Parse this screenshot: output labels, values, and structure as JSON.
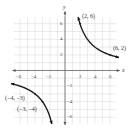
{
  "chart_data": {
    "type": "line",
    "title": "",
    "xlabel": "x",
    "ylabel": "y",
    "xlim": [
      -6,
      6
    ],
    "ylim": [
      -6,
      6
    ],
    "grid": true,
    "x_ticks": [
      -6,
      -4,
      -2,
      2,
      4,
      6
    ],
    "y_ticks": [
      -6,
      -4,
      -2,
      2,
      4,
      6
    ],
    "x_tick_labels": [
      "-6",
      "-4",
      "-2",
      "2",
      "4",
      "6"
    ],
    "y_tick_labels": [
      "-6",
      "-4",
      "-2",
      "2",
      "4",
      "6"
    ],
    "function": "y = 12/x",
    "series": [
      {
        "name": "branch-quadrant-I",
        "x": [
          1.8,
          2,
          3,
          4,
          6,
          7
        ],
        "y": [
          6.67,
          6,
          4,
          3,
          2,
          1.71
        ]
      },
      {
        "name": "branch-quadrant-III",
        "x": [
          -7,
          -6,
          -4,
          -3,
          -2,
          -1.8
        ],
        "y": [
          -1.71,
          -2,
          -3,
          -4,
          -6,
          -6.67
        ]
      }
    ],
    "annotations": [
      {
        "label": "(2, 6)",
        "x": 2,
        "y": 6
      },
      {
        "label": "(6, 2)",
        "x": 6,
        "y": 2
      },
      {
        "label": "(−4, −3)",
        "x": -4,
        "y": -3
      },
      {
        "label": "(−3, −4)",
        "x": -3,
        "y": -4
      }
    ]
  },
  "labels": {
    "x_axis": "x",
    "y_axis": "y",
    "p1": "(2, 6)",
    "p2": "(6, 2)",
    "p3": "(−4, −3)",
    "p4": "(−3, −4)",
    "xt": [
      "−6",
      "−4",
      "−2",
      "2",
      "4",
      "6"
    ],
    "yt": [
      "6",
      "4",
      "2",
      "−2",
      "−4",
      "−6"
    ]
  },
  "colors": {
    "curve": "#1a1a1a",
    "grid": "#cccccc",
    "axis": "#555555"
  }
}
